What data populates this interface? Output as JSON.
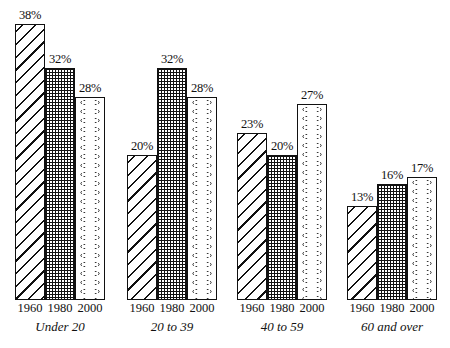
{
  "chart_data": {
    "type": "bar",
    "title": "",
    "xlabel": "",
    "ylabel": "",
    "categories": [
      "Under 20",
      "20 to 39",
      "40 to 59",
      "60 and over"
    ],
    "series": [
      {
        "name": "1960",
        "values": [
          38,
          20,
          23,
          13
        ],
        "pattern": "diagonal-hatch"
      },
      {
        "name": "1980",
        "values": [
          32,
          32,
          20,
          16
        ],
        "pattern": "crosshatch-grid"
      },
      {
        "name": "2000",
        "values": [
          28,
          28,
          27,
          17
        ],
        "pattern": "wavy-ovals"
      }
    ],
    "value_labels": [
      [
        "38%",
        "32%",
        "28%"
      ],
      [
        "20%",
        "32%",
        "28%"
      ],
      [
        "23%",
        "20%",
        "27%"
      ],
      [
        "13%",
        "16%",
        "17%"
      ]
    ],
    "ylim": [
      0,
      40
    ],
    "grid": false,
    "legend": "none (years shown under each bar)",
    "colors": {
      "ink": "#111111",
      "background": "#ffffff"
    }
  }
}
